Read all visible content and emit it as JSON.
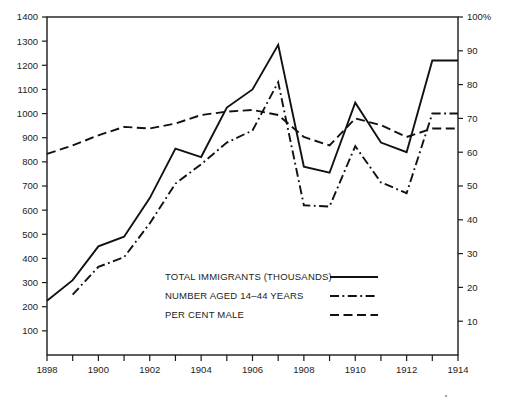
{
  "chart_data": {
    "type": "line",
    "title": "",
    "subtitle": "",
    "xlabel": "",
    "ylabel": "",
    "xlim": [
      1898,
      1914
    ],
    "ylim": [
      0,
      1400
    ],
    "y2lim": [
      0,
      100
    ],
    "y2label": "",
    "grid": false,
    "legend_position": "inside-center",
    "x_tick_values": [
      1898,
      1899,
      1900,
      1901,
      1902,
      1903,
      1904,
      1905,
      1906,
      1907,
      1908,
      1909,
      1910,
      1911,
      1912,
      1913,
      1914
    ],
    "x_tick_labels": [
      "1898",
      "",
      "1900",
      "",
      "1902",
      "",
      "1904",
      "",
      "1906",
      "",
      "1908",
      "",
      "1910",
      "",
      "1912",
      "",
      "1914"
    ],
    "y_tick_values": [
      100,
      200,
      300,
      400,
      500,
      600,
      700,
      800,
      900,
      1000,
      1100,
      1200,
      1300,
      1400
    ],
    "y_tick_labels": [
      "100",
      "200",
      "300",
      "400",
      "500",
      "600",
      "700",
      "800",
      "900",
      "1000",
      "1100",
      "1200",
      "1300",
      "1400"
    ],
    "y2_tick_values": [
      10,
      20,
      30,
      40,
      50,
      60,
      70,
      80,
      90,
      100
    ],
    "y2_tick_labels": [
      "10",
      "20",
      "30",
      "40",
      "50",
      "60",
      "70",
      "80",
      "90",
      "100%"
    ],
    "series": [
      {
        "name": "TOTAL IMMIGRANTS (THOUSANDS)",
        "style": "solid",
        "axis": "left",
        "x": [
          1898,
          1899,
          1900,
          1901,
          1902,
          1903,
          1904,
          1905,
          1906,
          1907,
          1908,
          1909,
          1910,
          1911,
          1912,
          1913,
          1914
        ],
        "values": [
          225,
          310,
          450,
          490,
          650,
          855,
          820,
          1025,
          1100,
          1285,
          780,
          755,
          1045,
          880,
          840,
          1220,
          1220
        ]
      },
      {
        "name": "NUMBER AGED 14–44 YEARS",
        "style": "dash-dot",
        "axis": "left",
        "x": [
          1899,
          1900,
          1901,
          1902,
          1903,
          1904,
          1905,
          1906,
          1907,
          1908,
          1909,
          1910,
          1911,
          1912,
          1913,
          1914
        ],
        "values": [
          250,
          365,
          405,
          545,
          710,
          790,
          880,
          930,
          1130,
          620,
          615,
          865,
          715,
          670,
          1000,
          1000
        ]
      },
      {
        "name": "PER CENT MALE",
        "style": "dashed",
        "axis": "right",
        "x": [
          1898,
          1899,
          1900,
          1901,
          1902,
          1903,
          1904,
          1905,
          1906,
          1907,
          1908,
          1909,
          1910,
          1911,
          1912,
          1913,
          1914
        ],
        "values": [
          59.5,
          62,
          65,
          67.5,
          67,
          68.5,
          71,
          72,
          72.5,
          71,
          64.5,
          62,
          70,
          68,
          64.5,
          67,
          67
        ]
      }
    ]
  },
  "legend": {
    "entries": [
      {
        "label": "TOTAL IMMIGRANTS (THOUSANDS)",
        "style": "solid"
      },
      {
        "label": "NUMBER AGED 14–44 YEARS",
        "style": "dash-dot"
      },
      {
        "label": "PER CENT MALE",
        "style": "dashed"
      }
    ]
  }
}
